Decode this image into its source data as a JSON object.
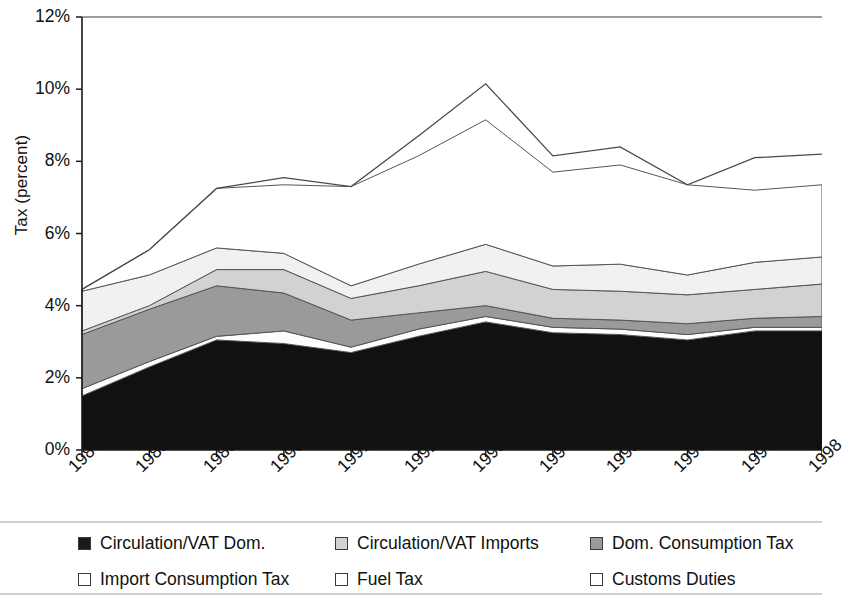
{
  "chart_data": {
    "type": "area",
    "stacked": true,
    "title": "",
    "xlabel": "",
    "ylabel": "Tax (percent)",
    "ylim": [
      0,
      12
    ],
    "ytick_labels": [
      "0%",
      "2%",
      "4%",
      "6%",
      "8%",
      "10%",
      "12%"
    ],
    "ytick_values": [
      0,
      2,
      4,
      6,
      8,
      10,
      12
    ],
    "grid": false,
    "legend_position": "bottom",
    "categories": [
      "1987",
      "1988",
      "1989",
      "1990",
      "1991",
      "1992",
      "1993",
      "1994",
      "1995",
      "1996",
      "1997",
      "1998"
    ],
    "x": [
      "1987",
      "1988",
      "1989",
      "1990",
      "1991",
      "1992",
      "1993",
      "1994",
      "1995",
      "1996",
      "1997",
      "1998"
    ],
    "series": [
      {
        "name": "Circulation/VAT Dom.",
        "color": "#111111",
        "values": [
          1.5,
          2.3,
          3.05,
          2.95,
          2.7,
          3.15,
          3.55,
          3.25,
          3.2,
          3.05,
          3.3,
          3.3
        ]
      },
      {
        "name": "Import Consumption Tax",
        "color": "#fdfdfd",
        "values": [
          0.2,
          0.15,
          0.1,
          0.35,
          0.15,
          0.2,
          0.15,
          0.15,
          0.15,
          0.15,
          0.1,
          0.1
        ]
      },
      {
        "name": "Dom. Consumption Tax",
        "color": "#9a9a9a",
        "values": [
          1.5,
          1.45,
          1.4,
          1.05,
          0.75,
          0.45,
          0.3,
          0.25,
          0.25,
          0.3,
          0.25,
          0.3
        ]
      },
      {
        "name": "Circulation/VAT Imports",
        "color": "#d2d2d2",
        "values": [
          0.1,
          0.1,
          0.45,
          0.65,
          0.6,
          0.75,
          0.95,
          0.8,
          0.8,
          0.8,
          0.8,
          0.9
        ]
      },
      {
        "name": "Fuel Tax",
        "color": "#f1f1f1",
        "values": [
          1.1,
          0.85,
          0.6,
          0.45,
          0.35,
          0.6,
          0.75,
          0.65,
          0.75,
          0.55,
          0.75,
          0.75
        ]
      },
      {
        "name": "Customs Duties",
        "color": "#ffffff",
        "values": [
          0.05,
          0.7,
          1.65,
          1.9,
          2.75,
          3.0,
          3.45,
          2.6,
          2.75,
          2.5,
          2.0,
          2.0
        ]
      }
    ],
    "cumulative_totals": [
      4.45,
      5.55,
      7.25,
      7.35,
      7.3,
      8.15,
      9.15,
      7.7,
      7.9,
      7.35,
      7.2,
      7.35
    ],
    "top_line_values": [
      4.45,
      5.55,
      7.25,
      7.55,
      7.3,
      8.7,
      10.15,
      8.15,
      8.4,
      7.35,
      8.1,
      8.2
    ]
  },
  "axes": {
    "y_title": "Tax (percent)",
    "y_ticks": [
      "12%",
      "10%",
      "8%",
      "6%",
      "4%",
      "2%",
      "0%"
    ],
    "x_ticks": [
      "1987",
      "1988",
      "1989",
      "1990",
      "1991",
      "1992",
      "1993",
      "1994",
      "1995",
      "1996",
      "1997",
      "1998"
    ]
  },
  "legend": {
    "items": [
      {
        "label": "Circulation/VAT Dom.",
        "swatch": "#1a1a1a",
        "icon": "legend-swatch-icon"
      },
      {
        "label": "Circulation/VAT Imports",
        "swatch": "#d2d2d2",
        "icon": "legend-swatch-icon"
      },
      {
        "label": "Dom. Consumption Tax",
        "swatch": "#9a9a9a",
        "icon": "legend-swatch-icon"
      },
      {
        "label": "Import Consumption Tax",
        "swatch": "#ffffff",
        "icon": "legend-swatch-icon"
      },
      {
        "label": "Fuel Tax",
        "swatch": "#ffffff",
        "icon": "legend-swatch-icon"
      },
      {
        "label": "Customs Duties",
        "swatch": "#ffffff",
        "icon": "legend-swatch-icon"
      }
    ]
  }
}
